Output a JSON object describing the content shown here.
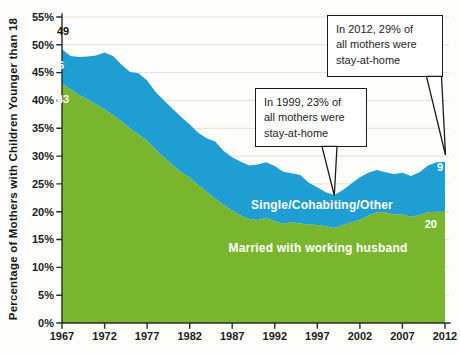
{
  "figure": {
    "background": "#fdfdfb"
  },
  "chart_data": {
    "type": "area",
    "stacked": true,
    "title": "",
    "xlabel": "",
    "ylabel": "Percentage of Mothers with Children Younger than 18",
    "ylim": [
      0,
      55
    ],
    "grid": "horizontal",
    "grid_color": "#e7ded7",
    "x": [
      1967,
      1968,
      1969,
      1970,
      1971,
      1972,
      1973,
      1974,
      1975,
      1976,
      1977,
      1978,
      1979,
      1980,
      1981,
      1982,
      1983,
      1984,
      1985,
      1986,
      1987,
      1988,
      1989,
      1990,
      1991,
      1992,
      1993,
      1994,
      1995,
      1996,
      1997,
      1998,
      1999,
      2000,
      2001,
      2002,
      2003,
      2004,
      2005,
      2006,
      2007,
      2008,
      2009,
      2010,
      2011,
      2012
    ],
    "x_ticks": [
      "1967",
      "1972",
      "1977",
      "1982",
      "1987",
      "1992",
      "1997",
      "2002",
      "2007",
      "2012"
    ],
    "y_ticks": [
      "0%",
      "5%",
      "10%",
      "15%",
      "20%",
      "25%",
      "30%",
      "35%",
      "40%",
      "45%",
      "50%",
      "55%"
    ],
    "series": [
      {
        "name": "Married with working husband",
        "color": "#79b62e",
        "values": [
          43,
          42,
          41,
          40.2,
          39.3,
          38.4,
          37.4,
          36.2,
          35,
          33.9,
          32.8,
          31.2,
          29.8,
          28.4,
          27.1,
          26.2,
          24.8,
          23.6,
          22.4,
          21.2,
          20.2,
          19.3,
          18.7,
          18.5,
          18.9,
          18.3,
          17.9,
          18.1,
          17.9,
          17.7,
          17.6,
          17.4,
          17.1,
          17.6,
          18.1,
          18.5,
          19.3,
          19.9,
          19.9,
          19.5,
          19.6,
          19.1,
          19.4,
          19.9,
          20,
          20
        ]
      },
      {
        "name": "Single/Cohabiting/Other",
        "color": "#1e9ed3",
        "values": [
          6.2,
          6,
          6.8,
          7.7,
          8.8,
          10.2,
          10.6,
          10.2,
          10.1,
          11,
          10.8,
          10.3,
          10.2,
          10.1,
          9.9,
          9.5,
          9.4,
          9.6,
          10.2,
          9.7,
          9.6,
          9.7,
          9.6,
          10,
          10,
          9.9,
          9.3,
          8.8,
          8.7,
          7.5,
          6.8,
          6.1,
          5.9,
          6.3,
          7,
          7.7,
          7.7,
          7.6,
          7.2,
          7.3,
          7.4,
          7.3,
          7.7,
          8.4,
          8.9,
          9
        ]
      }
    ],
    "point_labels": [
      {
        "text": "49",
        "series": "total",
        "year": 1967,
        "value": 49
      },
      {
        "text": "6",
        "series": "Single/Cohabiting/Other",
        "year": 1967,
        "value": 6
      },
      {
        "text": "43",
        "series": "Married with working husband",
        "year": 1967,
        "value": 43
      },
      {
        "text": "9",
        "series": "Single/Cohabiting/Other",
        "year": 2012,
        "value": 9
      },
      {
        "text": "20",
        "series": "Married with working husband",
        "year": 2012,
        "value": 20
      }
    ],
    "annotations": [
      {
        "lines": [
          "In 2012, 29% of",
          "all mothers were",
          "stay-at-home"
        ],
        "year": 2012,
        "value": 29
      },
      {
        "lines": [
          "In 1999, 23% of",
          "all mothers were",
          "stay-at-home"
        ],
        "year": 1999,
        "value": 23
      }
    ]
  }
}
